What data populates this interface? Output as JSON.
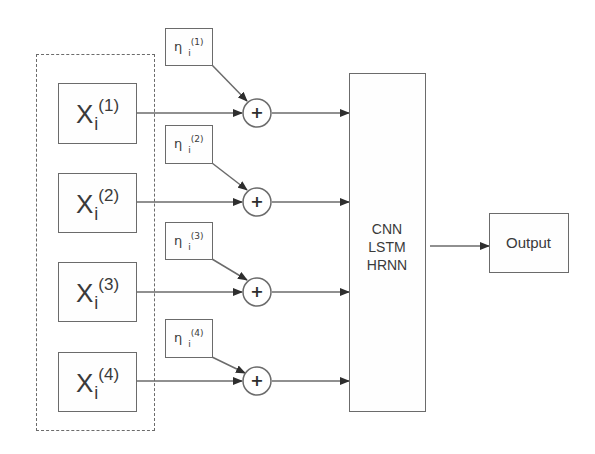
{
  "diagram": {
    "type": "block-diagram",
    "input_group": {
      "style": "dashed",
      "inputs": [
        {
          "base": "X",
          "sub": "i",
          "sup": "(1)"
        },
        {
          "base": "X",
          "sub": "i",
          "sup": "(2)"
        },
        {
          "base": "X",
          "sub": "i",
          "sup": "(3)"
        },
        {
          "base": "X",
          "sub": "i",
          "sup": "(4)"
        }
      ]
    },
    "noise_terms": [
      {
        "base": "η",
        "sub": "i",
        "sup": "(1)"
      },
      {
        "base": "η",
        "sub": "i",
        "sup": "(2)"
      },
      {
        "base": "η",
        "sub": "i",
        "sup": "(3)"
      },
      {
        "base": "η",
        "sub": "i",
        "sup": "(4)"
      }
    ],
    "adders": [
      {
        "symbol": "+"
      },
      {
        "symbol": "+"
      },
      {
        "symbol": "+"
      },
      {
        "symbol": "+"
      }
    ],
    "model": {
      "lines": [
        "CNN",
        "LSTM",
        "HRNN"
      ]
    },
    "output": {
      "label": "Output"
    },
    "colors": {
      "stroke": "#6b6b6b",
      "text": "#3a3a3a",
      "background": "#ffffff"
    }
  }
}
